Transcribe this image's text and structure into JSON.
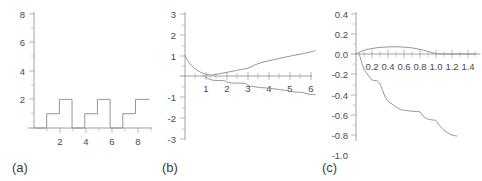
{
  "figure": {
    "background_color": "#ffffff",
    "line_color": "#8a8a8a",
    "axis_color": "#8c8c8c",
    "text_color": "#4a4a4a"
  },
  "panels": [
    {
      "label": "(a)",
      "y_ticks": [
        "2",
        "4",
        "6",
        "8"
      ],
      "x_ticks": [
        "2",
        "4",
        "6",
        "8"
      ]
    },
    {
      "label": "(b)",
      "y_ticks": [
        "3",
        "2",
        "1",
        "-1",
        "-2",
        "-3"
      ],
      "x_ticks": [
        "1",
        "2",
        "3",
        "4",
        "5",
        "6"
      ]
    },
    {
      "label": "(c)",
      "y_ticks": [
        "0.4",
        "0.2",
        "0.0",
        "-0.2",
        "-0.4",
        "-0.6",
        "-0.8",
        "-1.0"
      ],
      "x_ticks": [
        "0.2",
        "0.4",
        "0.6",
        "0.8",
        "1.0",
        "1.2",
        "1.4"
      ]
    }
  ],
  "chart_data": [
    {
      "type": "line",
      "title": "",
      "panel": "(a)",
      "xlabel": "",
      "ylabel": "",
      "xlim": [
        0,
        9.3
      ],
      "ylim": [
        0,
        8.3
      ],
      "grid": false,
      "legend": "none",
      "description": "Periodic staircase step function with period 3: rises to 1 at x=1, to 2 at x=2, drops to 0 at x=3, repeating.",
      "series": [
        {
          "name": "step-function",
          "style": "step",
          "x": [
            0,
            1,
            1,
            2,
            2,
            3,
            3,
            4,
            4,
            5,
            5,
            6,
            6,
            7,
            7,
            8,
            8,
            9.1
          ],
          "y": [
            0,
            0,
            1,
            1,
            2,
            2,
            0,
            0,
            1,
            1,
            2,
            2,
            0,
            0,
            1,
            1,
            2,
            2
          ]
        }
      ]
    },
    {
      "type": "line",
      "title": "",
      "panel": "(b)",
      "xlabel": "",
      "ylabel": "",
      "xlim": [
        0,
        6.4
      ],
      "ylim": [
        -3,
        3
      ],
      "grid": false,
      "legend": "none",
      "description": "Upper curve decays from 1.0 at x=0 to near 0 at x=1.2 then rises steadily to about 1.2 at x=6. Lower curve descends in a shallow staircase from 0 at x=1 to about -0.9 at x=6.",
      "series": [
        {
          "name": "upper-curve",
          "style": "smooth",
          "x": [
            0,
            0.15,
            0.3,
            0.5,
            0.75,
            1.0,
            1.25,
            1.5,
            1.8,
            2.1,
            2.4,
            2.7,
            3.0,
            3.3,
            3.6,
            4.0,
            4.4,
            4.8,
            5.2,
            5.6,
            6.0,
            6.2
          ],
          "y": [
            1.0,
            0.72,
            0.52,
            0.33,
            0.18,
            0.08,
            0.05,
            0.08,
            0.14,
            0.2,
            0.26,
            0.32,
            0.38,
            0.52,
            0.64,
            0.74,
            0.83,
            0.92,
            1.0,
            1.08,
            1.17,
            1.22
          ]
        },
        {
          "name": "lower-curve",
          "style": "step-smooth",
          "x": [
            0.9,
            1.1,
            1.3,
            1.6,
            1.9,
            2.0,
            2.3,
            2.6,
            2.9,
            3.0,
            3.3,
            3.6,
            3.9,
            4.2,
            4.5,
            4.8,
            5.0,
            5.3,
            5.6,
            5.9,
            6.2
          ],
          "y": [
            0.0,
            -0.12,
            -0.2,
            -0.22,
            -0.23,
            -0.3,
            -0.34,
            -0.35,
            -0.36,
            -0.46,
            -0.52,
            -0.56,
            -0.58,
            -0.62,
            -0.66,
            -0.69,
            -0.74,
            -0.78,
            -0.8,
            -0.88,
            -0.9
          ]
        }
      ]
    },
    {
      "type": "line",
      "title": "",
      "panel": "(c)",
      "xlabel": "",
      "ylabel": "",
      "xlim": [
        0,
        1.58
      ],
      "ylim": [
        -1.0,
        0.5
      ],
      "grid": false,
      "legend": "none",
      "description": "Arch curve rises from 0 at x=0 to a peak near 0.07 at x=0.5 and returns to 0 near x=1.0, then flat. Lower curve descends in a staircase from 0 at x=0.05 to about -0.82 at x=1.25.",
      "series": [
        {
          "name": "arch-curve",
          "style": "smooth",
          "x": [
            0.0,
            0.06,
            0.12,
            0.2,
            0.3,
            0.4,
            0.5,
            0.6,
            0.7,
            0.8,
            0.88,
            0.95,
            1.0,
            1.1,
            1.25,
            1.4,
            1.55
          ],
          "y": [
            0.0,
            0.025,
            0.042,
            0.055,
            0.066,
            0.071,
            0.072,
            0.069,
            0.061,
            0.046,
            0.03,
            0.014,
            0.004,
            0.0,
            0.0,
            0.0,
            0.0
          ]
        },
        {
          "name": "staircase-curve",
          "style": "step-smooth",
          "x": [
            0.04,
            0.07,
            0.1,
            0.14,
            0.18,
            0.2,
            0.24,
            0.27,
            0.3,
            0.33,
            0.36,
            0.4,
            0.45,
            0.5,
            0.56,
            0.62,
            0.68,
            0.74,
            0.8,
            0.84,
            0.88,
            0.92,
            0.96,
            1.0,
            1.03,
            1.06,
            1.1,
            1.15,
            1.2,
            1.26
          ],
          "y": [
            0.0,
            -0.08,
            -0.15,
            -0.2,
            -0.24,
            -0.26,
            -0.265,
            -0.27,
            -0.3,
            -0.36,
            -0.42,
            -0.47,
            -0.5,
            -0.53,
            -0.555,
            -0.565,
            -0.57,
            -0.575,
            -0.58,
            -0.62,
            -0.645,
            -0.655,
            -0.66,
            -0.665,
            -0.7,
            -0.73,
            -0.76,
            -0.79,
            -0.81,
            -0.82
          ]
        }
      ]
    }
  ]
}
